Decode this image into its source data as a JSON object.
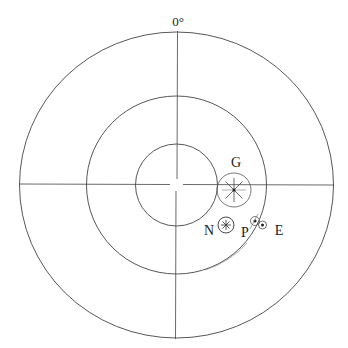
{
  "diagram": {
    "type": "polar-target",
    "top_label": "0°",
    "center": [
      176.5,
      185
    ],
    "rings": [
      {
        "name": "outer-ring",
        "rx": 157,
        "ry": 153
      },
      {
        "name": "middle-ring",
        "rx": 90,
        "ry": 89
      },
      {
        "name": "inner-ring",
        "rx": 41,
        "ry": 41
      }
    ],
    "markers": [
      {
        "id": "G",
        "label": "G",
        "cx": 234,
        "cy": 190,
        "r": 17,
        "label_x": 236,
        "label_y": 167
      },
      {
        "id": "N",
        "label": "N",
        "cx": 226,
        "cy": 225,
        "r": 8,
        "label_x": 209,
        "label_y": 235
      },
      {
        "id": "P",
        "label": "P",
        "cx": 255,
        "cy": 221,
        "r": 4,
        "label_x": 245,
        "label_y": 236
      },
      {
        "id": "E",
        "label": "E",
        "cx": 262,
        "cy": 225,
        "r": 4,
        "label_x": 279,
        "label_y": 235
      }
    ]
  },
  "labels": {
    "top": "0°",
    "G": "G",
    "N": "N",
    "P": "P",
    "E": "E"
  },
  "colors": {
    "line": "#333333",
    "faint_line": "#999999",
    "text": "#222222"
  }
}
